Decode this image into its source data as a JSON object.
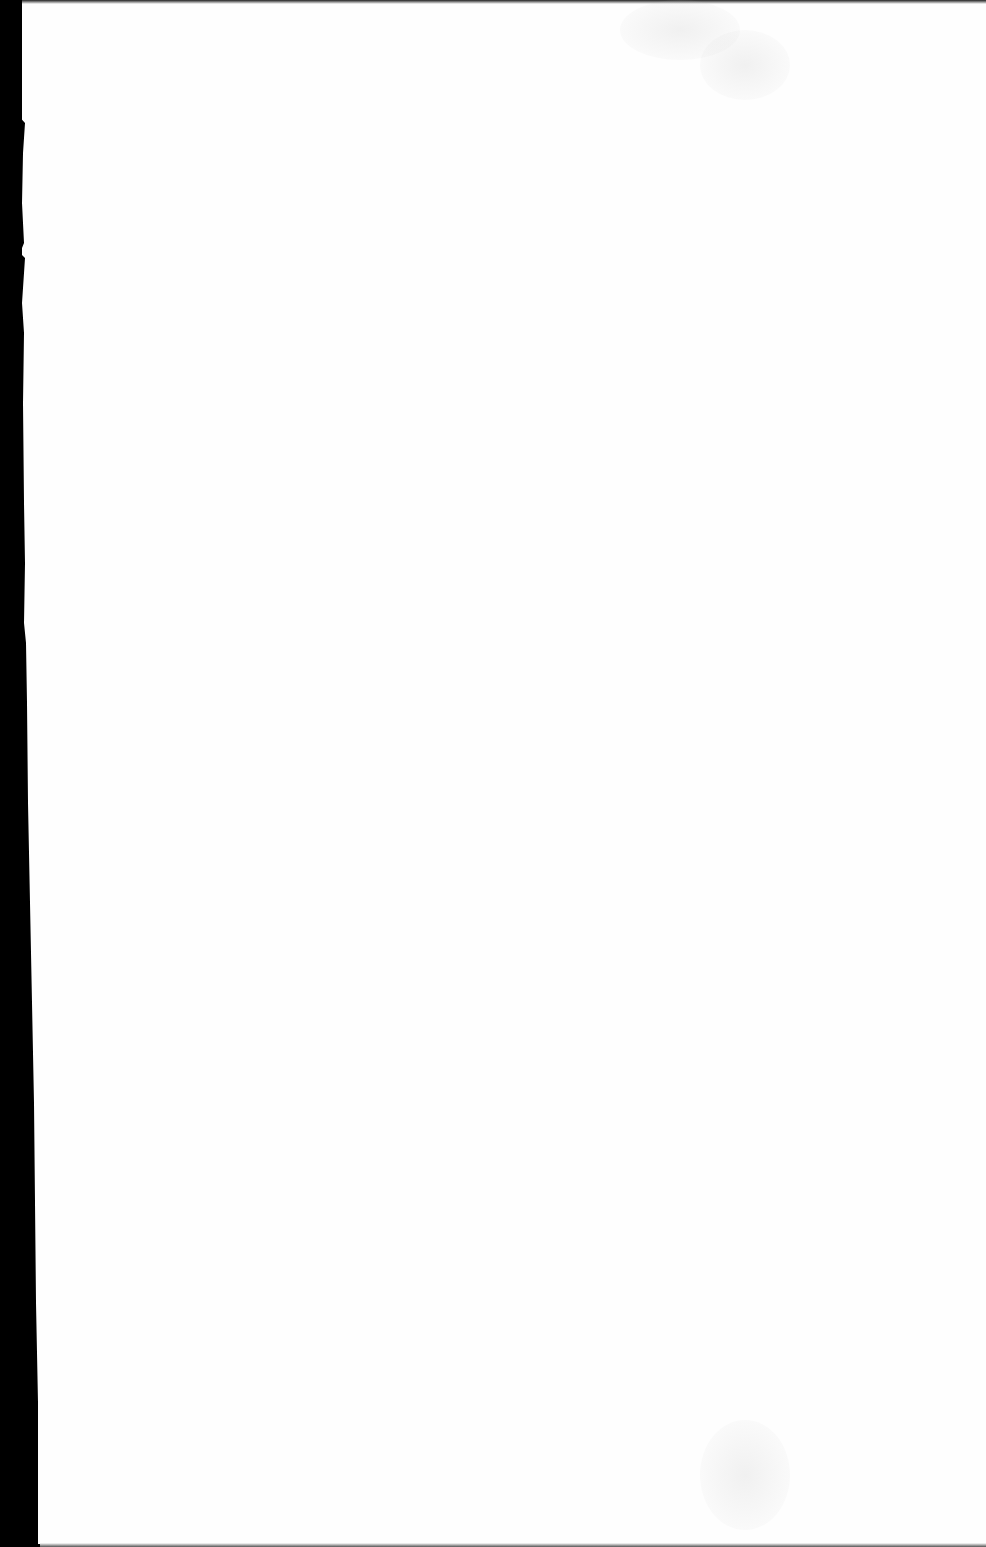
{
  "page": {
    "type": "scanned-blank-page",
    "paper_color": "#fefefe",
    "background_color": "#000000",
    "text_content": ""
  }
}
